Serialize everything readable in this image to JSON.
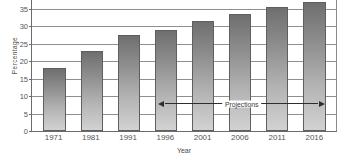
{
  "chart_data": {
    "type": "bar",
    "title": "",
    "xlabel": "Year",
    "ylabel": "Percentage",
    "categories": [
      "1971",
      "1981",
      "1991",
      "1996",
      "2001",
      "2006",
      "2011",
      "2016"
    ],
    "values": [
      18,
      23,
      27.5,
      29,
      31.5,
      33.3,
      35.5,
      37
    ],
    "ylim": [
      0,
      40
    ],
    "ytick_labels": [
      "0",
      "5",
      "10",
      "15",
      "20",
      "25",
      "30",
      "35",
      "40"
    ],
    "ytick_values": [
      0,
      5,
      10,
      15,
      20,
      25,
      30,
      35,
      40
    ],
    "grid": true,
    "legend": "none",
    "annotations": [
      {
        "text": "Projections",
        "type": "double-headed-arrow",
        "from_category": "1996",
        "to_category": "2016",
        "y_value": 8
      }
    ],
    "bar_style": {
      "fill": "vertical-gradient-gray",
      "top_color": "#6f6f6f",
      "bottom_color": "#d2d2d2",
      "border_color": "#5f5f5f"
    },
    "axis_color": "#6b6b6b",
    "gridline_color": "#8f8f8f"
  }
}
